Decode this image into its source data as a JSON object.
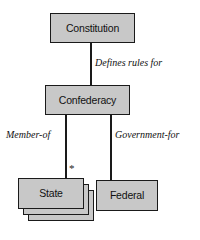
{
  "diagram": {
    "type": "entity-relationship-diagram",
    "width": 200,
    "height": 240,
    "background_color": "#ffffff",
    "node_fill_color": "#c8c8c8",
    "node_border_color": "#1a1a1a",
    "text_color": "#111111",
    "nodes": [
      {
        "id": "constitution",
        "label": "Constitution",
        "stacked": false
      },
      {
        "id": "confederacy",
        "label": "Confederacy",
        "stacked": false
      },
      {
        "id": "state",
        "label": "State",
        "stacked": true,
        "stack_layers": 3
      },
      {
        "id": "federal",
        "label": "Federal",
        "stacked": false
      }
    ],
    "edges": [
      {
        "id": "constitution-confederacy",
        "from": "constitution",
        "to": "confederacy",
        "label": "Defines rules for",
        "multiplicity": ""
      },
      {
        "id": "confederacy-state",
        "from": "confederacy",
        "to": "state",
        "label": "Member-of",
        "multiplicity": "*"
      },
      {
        "id": "confederacy-federal",
        "from": "confederacy",
        "to": "federal",
        "label": "Government-for",
        "multiplicity": ""
      }
    ]
  }
}
